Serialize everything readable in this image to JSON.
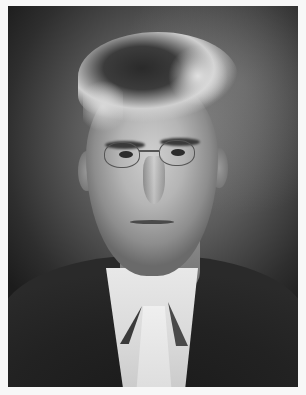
{
  "image": {
    "type": "photograph",
    "style": "black-and-white studio portrait",
    "subject": "elderly man with round wire-rim glasses, light tousled hair, dark suit jacket, white shirt and light tie",
    "border_color": "#f7f7f7",
    "palette": {
      "background_dark": "#1c1c1c",
      "background_mid": "#5a5a5a",
      "face_light": "#cfcfcf",
      "shirt": "#e8e8e8",
      "coat": "#1a1a1a"
    }
  }
}
